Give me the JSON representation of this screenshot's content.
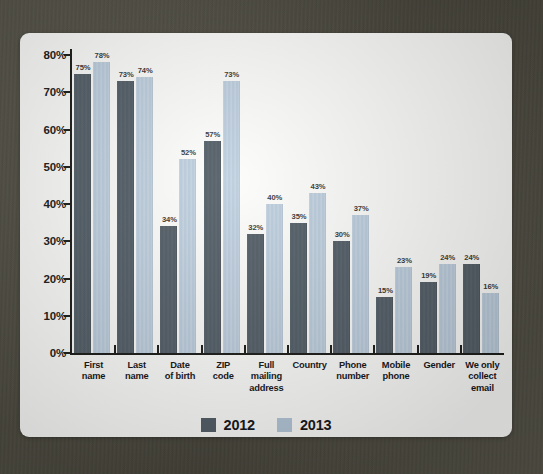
{
  "chart_data": {
    "type": "bar",
    "title": "",
    "subtitle": "",
    "xlabel": "",
    "ylabel": "",
    "ylim": [
      0,
      80
    ],
    "yticks": [
      0,
      10,
      20,
      30,
      40,
      50,
      60,
      70,
      80
    ],
    "ytick_labels": [
      "0%",
      "10%",
      "20%",
      "30%",
      "40%",
      "50%",
      "60%",
      "70%",
      "80%"
    ],
    "grid": false,
    "legend_position": "bottom-center",
    "value_label_suffix": "%",
    "categories": [
      "First name",
      "Last name",
      "Date of birth",
      "ZIP code",
      "Full mailing address",
      "Country",
      "Phone number",
      "Mobile phone",
      "Gender",
      "We only collect email"
    ],
    "category_lines": [
      [
        "First",
        "name"
      ],
      [
        "Last",
        "name"
      ],
      [
        "Date",
        "of birth"
      ],
      [
        "ZIP",
        "code"
      ],
      [
        "Full",
        "mailing",
        "address"
      ],
      [
        "Country"
      ],
      [
        "Phone",
        "number"
      ],
      [
        "Mobile",
        "phone"
      ],
      [
        "Gender"
      ],
      [
        "We only",
        "collect",
        "email"
      ]
    ],
    "series": [
      {
        "name": "2012",
        "color": "#545f68",
        "values": [
          75,
          73,
          34,
          57,
          32,
          35,
          30,
          15,
          19,
          24
        ],
        "labels": [
          "75%",
          "73%",
          "34%",
          "57%",
          "32%",
          "35%",
          "30%",
          "15%",
          "19%",
          "24%"
        ]
      },
      {
        "name": "2013",
        "color": "#b5c8da",
        "values": [
          78,
          74,
          52,
          73,
          40,
          43,
          37,
          23,
          24,
          16
        ],
        "labels": [
          "78%",
          "74%",
          "52%",
          "73%",
          "40%",
          "43%",
          "37%",
          "23%",
          "24%",
          "16%"
        ]
      }
    ]
  },
  "legend": {
    "items": [
      {
        "label": "2012",
        "color": "#545f68"
      },
      {
        "label": "2013",
        "color": "#b5c8da"
      }
    ]
  },
  "colors": {
    "series_2012": "#545f68",
    "series_2013": "#b5c8da",
    "axis": "#1d1d1b",
    "card_background": "#fdfdfc",
    "frame_background": "#514f43",
    "label_text": "#17171a"
  }
}
